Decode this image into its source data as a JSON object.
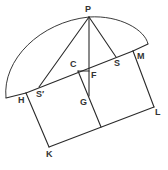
{
  "diagram": {
    "type": "geometric-construction",
    "stroke_color": "#2a2a2a",
    "background": "#ffffff",
    "points": {
      "P": {
        "label": "P",
        "x": 89,
        "y": 17
      },
      "H": {
        "label": "H",
        "x": 26,
        "y": 93
      },
      "M": {
        "label": "M",
        "x": 133,
        "y": 51
      },
      "S_prime": {
        "label": "S′",
        "x": 39,
        "y": 87
      },
      "S": {
        "label": "S",
        "x": 116,
        "y": 57
      },
      "C": {
        "label": "C",
        "x": 78,
        "y": 71
      },
      "F": {
        "label": "F",
        "x": 89,
        "y": 71
      },
      "G": {
        "label": "G",
        "x": 89,
        "y": 96
      },
      "K": {
        "label": "K",
        "x": 49,
        "y": 147
      },
      "L": {
        "label": "L",
        "x": 154,
        "y": 107
      }
    },
    "labels": [
      "P",
      "C",
      "F",
      "S",
      "M",
      "H",
      "S′",
      "G",
      "L",
      "K"
    ]
  }
}
